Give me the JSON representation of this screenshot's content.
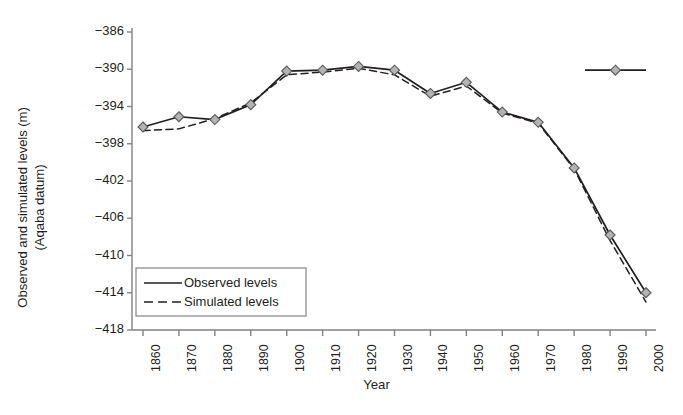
{
  "chart_data": {
    "type": "line",
    "title": "",
    "xlabel": "Year",
    "ylabel": "Observed and simulated levels (m) (Aqaba datum)",
    "ylabel_line1": "Observed and simulated levels (m)",
    "ylabel_line2": "(Aqaba datum)",
    "xlim": [
      1855,
      2005
    ],
    "ylim": [
      -418,
      -386
    ],
    "ytick_step": 4,
    "grid": false,
    "legend_position": "lower-left-inside",
    "categories": [
      1860,
      1870,
      1880,
      1890,
      1900,
      1910,
      1920,
      1930,
      1940,
      1950,
      1960,
      1970,
      1980,
      1990,
      2000
    ],
    "xtick_labels": [
      "1860",
      "1870",
      "1880",
      "1890",
      "1900",
      "1910",
      "1920",
      "1930",
      "1940",
      "1950",
      "1960",
      "1970",
      "1980",
      "1990",
      "2000"
    ],
    "ytick_labels": [
      "−386",
      "−390",
      "−394",
      "−398",
      "−402",
      "−406",
      "−410",
      "−414",
      "−418"
    ],
    "ytick_values": [
      -386,
      -390,
      -394,
      -398,
      -402,
      -406,
      -410,
      -414,
      -418
    ],
    "series": [
      {
        "name": "Observed levels",
        "style": "solid",
        "marker": "diamond",
        "x": [
          1860,
          1870,
          1880,
          1890,
          1900,
          1910,
          1920,
          1930,
          1940,
          1950,
          1960,
          1970,
          1980,
          1990,
          2000
        ],
        "values": [
          -396.2,
          -395.1,
          -395.4,
          -393.8,
          -390.2,
          -390.1,
          -389.7,
          -390.1,
          -392.6,
          -391.4,
          -394.6,
          -395.7,
          -400.6,
          -407.8,
          -414.0
        ]
      },
      {
        "name": "Simulated levels",
        "style": "dashed",
        "marker": "none",
        "x": [
          1860,
          1870,
          1880,
          1890,
          1900,
          1910,
          1920,
          1930,
          1940,
          1950,
          1960,
          1970,
          1980,
          1990,
          2000
        ],
        "values": [
          -396.6,
          -396.4,
          -395.3,
          -393.6,
          -390.6,
          -390.3,
          -389.9,
          -390.6,
          -392.9,
          -391.8,
          -394.7,
          -395.8,
          -400.7,
          -408.4,
          -415.0
        ]
      }
    ],
    "legend_entries": [
      {
        "label": "Observed levels",
        "style": "solid"
      },
      {
        "label": "Simulated levels",
        "style": "dashed"
      }
    ],
    "annotation_marker": {
      "x_start": 1983,
      "x_end": 2000,
      "y": -390.1,
      "marker": "diamond",
      "description": "isolated horizontal segment with diamond marker near 1990"
    },
    "colors": {
      "line": "#231f20",
      "marker_fill": "#b3b3b3",
      "marker_edge": "#58595b",
      "axis": "#808285",
      "text": "#231f20",
      "background": "#ffffff"
    }
  }
}
